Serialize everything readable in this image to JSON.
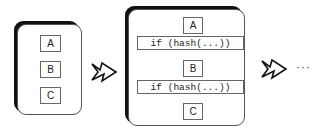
{
  "panels": [
    {
      "blocks": [
        "A",
        "B",
        "C"
      ]
    },
    {
      "blocks": [
        "A",
        "if (hash(...))",
        "B",
        "if (hash(...))",
        "C"
      ]
    }
  ],
  "continuation": "···"
}
